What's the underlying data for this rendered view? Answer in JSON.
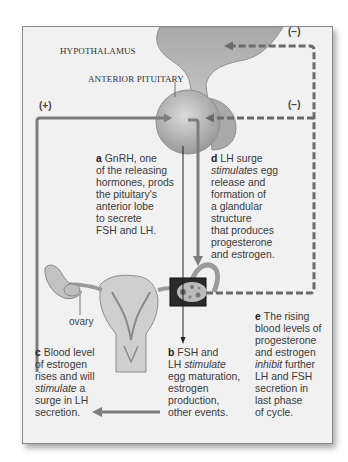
{
  "figure": {
    "labels": {
      "hypothalamus": "HYPOTHALAMUS",
      "anterior_pituitary": "ANTERIOR PITUITARY",
      "ovary": "ovary"
    },
    "feedback_signs": {
      "positive": "(+)",
      "negative_top": "(−)",
      "negative_mid": "(−)"
    },
    "captions": {
      "a": {
        "key": "a",
        "lines": [
          "GnRH, one",
          "of the releasing",
          "hormones, prods",
          "the pituitary's",
          "anterior lobe",
          "to secrete",
          "FSH and LH."
        ]
      },
      "b": {
        "key": "b",
        "line1": "FSH and",
        "line2_pre": "LH ",
        "line2_em": "stimulate",
        "lines_rest": [
          "egg maturation,",
          "estrogen",
          "production,",
          "other events."
        ]
      },
      "c": {
        "key": "c",
        "line1": "Blood level",
        "line2": "of estrogen",
        "line3": "rises and will",
        "line4_em": "stimulate",
        "line4_post": " a",
        "line5": "surge in LH",
        "line6": "secretion."
      },
      "d": {
        "key": "d",
        "line1": "LH surge",
        "line2_em": "stimulates",
        "line2_post": " egg",
        "lines_rest": [
          "release and",
          "formation of",
          "a glandular",
          "structure",
          "that produces",
          "progesterone",
          "and estrogen."
        ]
      },
      "e": {
        "key": "e",
        "line1": "The rising",
        "line2": "blood levels of",
        "line3": "progesterone",
        "line4": "and estrogen",
        "line5_em": "inhibit",
        "line5_post": " further",
        "lines_rest": [
          "LH and FSH",
          "secretion in",
          "last phase",
          "of cycle."
        ]
      }
    },
    "colors": {
      "panel_bg": "#f1f1f1",
      "arrow_gray": "#7d7d7d",
      "dashed_arrow": "#6a6a6a",
      "organ_fill": "#b5b5b5",
      "text": "#3a3a3a"
    }
  }
}
